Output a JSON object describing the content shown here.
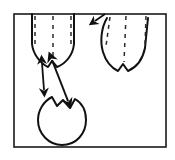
{
  "figure": {
    "title": "Tooth roots with circular lesion and measurement arrows",
    "domain": "Diagram",
    "canvas": {
      "width": 175,
      "height": 160,
      "background": "#ffffff"
    },
    "frame": {
      "name": "outer-frame",
      "x": 14,
      "y": 14,
      "width": 152,
      "height": 133,
      "stroke": "#1a1a1a",
      "stroke_width": 1.6,
      "fill": "none"
    },
    "colors": {
      "ink": "#111111",
      "paper": "#ffffff",
      "dash": "#3a3a3a"
    },
    "shapes": [
      {
        "name": "left-tooth-root",
        "kind": "outline",
        "description": "Left tooth root, two-pronged bifurcated base, open at top",
        "path": "M 32 14 L 32 44 C 33 54 40 63 48 67 L 52 61 L 57 67 C 67 63 73 54 74 44 L 74 14",
        "stroke": "#111111",
        "stroke_width": 2.0,
        "fill": "none"
      },
      {
        "name": "left-tooth-dash-left",
        "kind": "dashed-line",
        "path": "M 35 16 L 35 46",
        "stroke": "#2b2b2b",
        "stroke_width": 1.5,
        "dash_array": "4 4"
      },
      {
        "name": "left-tooth-dash-center",
        "kind": "dashed-line",
        "path": "M 53 16 L 53 59",
        "stroke": "#2b2b2b",
        "stroke_width": 1.5,
        "dash_array": "4 5"
      },
      {
        "name": "left-tooth-dash-right",
        "kind": "dashed-line",
        "path": "M 71 16 L 71 45",
        "stroke": "#2b2b2b",
        "stroke_width": 1.5,
        "dash_array": "4 4"
      },
      {
        "name": "right-tooth-root",
        "kind": "outline",
        "description": "Right tooth root, two-pronged bifurcated base, open at top",
        "path": "M 107 18 C 101 28 100 42 103 52 C 106 62 112 68 118 71 L 123 64 L 128 71 C 137 67 143 58 145 48 L 148 18",
        "stroke": "#111111",
        "stroke_width": 2.0,
        "fill": "none"
      },
      {
        "name": "right-tooth-dash-left",
        "kind": "dashed-line",
        "path": "M 110 17 L 106 46",
        "stroke": "#2b2b2b",
        "stroke_width": 1.5,
        "dash_array": "4 4"
      },
      {
        "name": "right-tooth-dash-center",
        "kind": "dashed-line",
        "path": "M 126 16 L 124 62",
        "stroke": "#2b2b2b",
        "stroke_width": 1.5,
        "dash_array": "4 5"
      },
      {
        "name": "right-tooth-dash-right",
        "kind": "dashed-line",
        "path": "M 146 16 L 145 45",
        "stroke": "#2b2b2b",
        "stroke_width": 1.5,
        "dash_array": "4 4"
      },
      {
        "name": "circular-lesion",
        "kind": "outline",
        "description": "Circular lesion / cyst outline with notch at top",
        "path": "M 52 97 C 44 101 38 110 38 120 C 38 134 49 145 62 145 C 76 145 86 134 86 120 C 86 111 82 103 75 99 L 70 108 L 63 100 L 57 106 Z",
        "stroke": "#111111",
        "stroke_width": 2.0,
        "fill": "none"
      },
      {
        "name": "top-right-arrowhead",
        "kind": "arrowhead",
        "description": "Small arrowhead pointing down-left near top edge",
        "path": "M 105 14 L 95 21",
        "stroke": "#111111",
        "stroke_width": 1.8
      }
    ],
    "arrows": [
      {
        "name": "short-measurement-arrow",
        "kind": "double-headed-arrow",
        "description": "Short vertical double-headed arrow between left root notch and lesion top",
        "x1": 42,
        "y1": 63,
        "x2": 44,
        "y2": 90,
        "stroke": "#111111",
        "stroke_width": 1.8,
        "heads": "both"
      },
      {
        "name": "long-measurement-arrow",
        "kind": "double-headed-arrow",
        "description": "Long diagonal double-headed arrow from left root apex to lesion notch",
        "x1": 52,
        "y1": 60,
        "x2": 68,
        "y2": 101,
        "stroke": "#111111",
        "stroke_width": 2.0,
        "heads": "both"
      }
    ],
    "labels": []
  }
}
